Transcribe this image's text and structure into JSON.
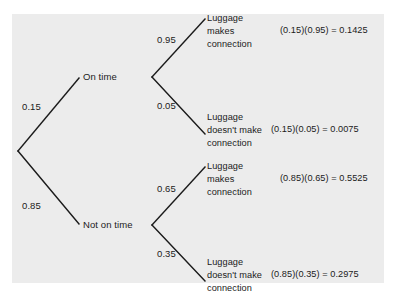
{
  "figure": {
    "type": "probability-tree-diagram",
    "background_color": "#ffffff",
    "panel_color": "#ececec",
    "line_color": "#1b1b1b"
  },
  "tree": {
    "root": {
      "branches": [
        {
          "probability": "0.15",
          "node_label": "On time",
          "children": [
            {
              "probability": "0.95",
              "outcome_lines": [
                "Luggage",
                "makes",
                "connection"
              ],
              "product": "(0.15)(0.95) = 0.1425"
            },
            {
              "probability": "0.05",
              "outcome_lines": [
                "Luggage",
                "doesn't make",
                "connection"
              ],
              "product": "(0.15)(0.05) = 0.0075"
            }
          ]
        },
        {
          "probability": "0.85",
          "node_label": "Not on time",
          "children": [
            {
              "probability": "0.65",
              "outcome_lines": [
                "Luggage",
                "makes",
                "connection"
              ],
              "product": "(0.85)(0.65) = 0.5525"
            },
            {
              "probability": "0.35",
              "outcome_lines": [
                "Luggage",
                "doesn't make",
                "connection"
              ],
              "product": "(0.85)(0.35) = 0.2975"
            }
          ]
        }
      ]
    }
  }
}
